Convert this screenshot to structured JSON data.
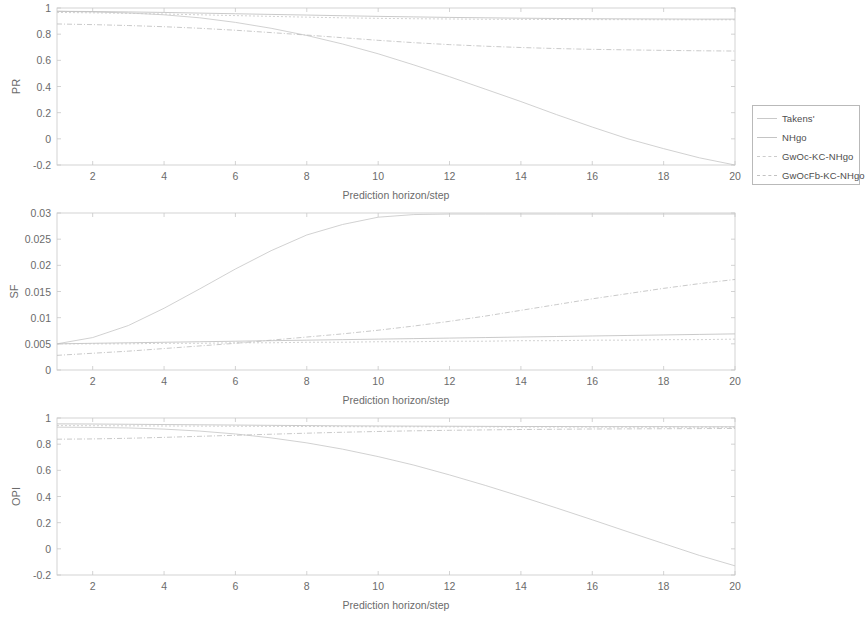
{
  "legend": {
    "items": [
      {
        "label": "Takens'",
        "color": "#c9c9c9",
        "dash": "none"
      },
      {
        "label": "NHgo",
        "color": "#c4c4c4",
        "dash": "none"
      },
      {
        "label": "GwOc-KC-NHgo",
        "color": "#cccccc",
        "dash": "2,2"
      },
      {
        "label": "GwOcFb-KC-NHgo",
        "color": "#c2c2c2",
        "dash": "4,2"
      }
    ]
  },
  "chart_data": [
    {
      "type": "line",
      "title": "",
      "xlabel": "Prediction horizon/step",
      "ylabel": "PR",
      "xlim": [
        1,
        20
      ],
      "ylim": [
        -0.2,
        1
      ],
      "xticks": [
        2,
        4,
        6,
        8,
        10,
        12,
        14,
        16,
        18,
        20
      ],
      "yticks": [
        -0.2,
        0,
        0.2,
        0.4,
        0.6,
        0.8,
        1
      ],
      "grid": false,
      "legend_position": "outside-right",
      "x": [
        1,
        2,
        3,
        4,
        5,
        6,
        7,
        8,
        9,
        10,
        11,
        12,
        13,
        14,
        15,
        16,
        17,
        18,
        19,
        20
      ],
      "series": [
        {
          "name": "Takens'",
          "values": [
            0.975,
            0.97,
            0.962,
            0.948,
            0.925,
            0.89,
            0.845,
            0.79,
            0.725,
            0.65,
            0.565,
            0.475,
            0.38,
            0.285,
            0.185,
            0.09,
            0.0,
            -0.075,
            -0.145,
            -0.2
          ]
        },
        {
          "name": "NHgo",
          "values": [
            0.975,
            0.973,
            0.97,
            0.966,
            0.961,
            0.956,
            0.951,
            0.946,
            0.941,
            0.936,
            0.932,
            0.928,
            0.925,
            0.922,
            0.92,
            0.918,
            0.917,
            0.916,
            0.915,
            0.915
          ]
        },
        {
          "name": "GwOc-KC-NHgo",
          "values": [
            0.966,
            0.963,
            0.959,
            0.954,
            0.948,
            0.942,
            0.936,
            0.93,
            0.925,
            0.921,
            0.918,
            0.916,
            0.914,
            0.913,
            0.912,
            0.911,
            0.911,
            0.91,
            0.91,
            0.91
          ]
        },
        {
          "name": "GwOcFb-KC-NHgo",
          "values": [
            0.878,
            0.873,
            0.866,
            0.857,
            0.845,
            0.83,
            0.812,
            0.793,
            0.773,
            0.753,
            0.735,
            0.72,
            0.708,
            0.698,
            0.69,
            0.684,
            0.68,
            0.676,
            0.673,
            0.671
          ]
        }
      ]
    },
    {
      "type": "line",
      "title": "",
      "xlabel": "Prediction horizon/step",
      "ylabel": "SF",
      "xlim": [
        1,
        20
      ],
      "ylim": [
        0,
        0.03
      ],
      "xticks": [
        2,
        4,
        6,
        8,
        10,
        12,
        14,
        16,
        18,
        20
      ],
      "yticks": [
        0,
        0.005,
        0.01,
        0.015,
        0.02,
        0.025,
        0.03
      ],
      "grid": false,
      "legend_position": "none",
      "x": [
        1,
        2,
        3,
        4,
        5,
        6,
        7,
        8,
        9,
        10,
        11,
        12,
        13,
        14,
        15,
        16,
        17,
        18,
        19,
        20
      ],
      "series": [
        {
          "name": "Takens'",
          "values": [
            0.005,
            0.0062,
            0.0085,
            0.0118,
            0.0155,
            0.0193,
            0.0228,
            0.0258,
            0.0278,
            0.0292,
            0.0297,
            0.0298,
            0.0298,
            0.0298,
            0.0298,
            0.0298,
            0.0298,
            0.0298,
            0.0298,
            0.0298
          ]
        },
        {
          "name": "NHgo",
          "values": [
            0.005,
            0.0051,
            0.0052,
            0.0053,
            0.0054,
            0.0055,
            0.0056,
            0.0057,
            0.0058,
            0.0059,
            0.006,
            0.0061,
            0.0062,
            0.0063,
            0.0064,
            0.0065,
            0.0066,
            0.0067,
            0.0068,
            0.0069
          ]
        },
        {
          "name": "GwOc-KC-NHgo",
          "values": [
            0.005,
            0.005,
            0.005,
            0.0051,
            0.0051,
            0.0052,
            0.0052,
            0.0053,
            0.0053,
            0.0054,
            0.0054,
            0.0055,
            0.0055,
            0.0056,
            0.0056,
            0.0057,
            0.0057,
            0.0058,
            0.0058,
            0.0059
          ]
        },
        {
          "name": "GwOcFb-KC-NHgo",
          "values": [
            0.0028,
            0.0032,
            0.0036,
            0.0041,
            0.0046,
            0.0051,
            0.0057,
            0.0063,
            0.0069,
            0.0076,
            0.0084,
            0.0093,
            0.0103,
            0.0114,
            0.0125,
            0.0136,
            0.0146,
            0.0156,
            0.0165,
            0.0173
          ]
        }
      ]
    },
    {
      "type": "line",
      "title": "",
      "xlabel": "Prediction horizon/step",
      "ylabel": "OPI",
      "xlim": [
        1,
        20
      ],
      "ylim": [
        -0.2,
        1
      ],
      "xticks": [
        2,
        4,
        6,
        8,
        10,
        12,
        14,
        16,
        18,
        20
      ],
      "yticks": [
        -0.2,
        0,
        0.2,
        0.4,
        0.6,
        0.8,
        1
      ],
      "grid": false,
      "legend_position": "none",
      "x": [
        1,
        2,
        3,
        4,
        5,
        6,
        7,
        8,
        9,
        10,
        11,
        12,
        13,
        14,
        15,
        16,
        17,
        18,
        19,
        20
      ],
      "series": [
        {
          "name": "Takens'",
          "values": [
            0.93,
            0.928,
            0.924,
            0.915,
            0.9,
            0.878,
            0.848,
            0.81,
            0.762,
            0.705,
            0.64,
            0.565,
            0.485,
            0.4,
            0.312,
            0.222,
            0.13,
            0.04,
            -0.05,
            -0.13
          ]
        },
        {
          "name": "NHgo",
          "values": [
            0.955,
            0.954,
            0.952,
            0.95,
            0.948,
            0.946,
            0.944,
            0.942,
            0.94,
            0.939,
            0.938,
            0.937,
            0.936,
            0.935,
            0.935,
            0.934,
            0.934,
            0.934,
            0.933,
            0.933
          ]
        },
        {
          "name": "GwOc-KC-NHgo",
          "values": [
            0.942,
            0.941,
            0.94,
            0.939,
            0.938,
            0.937,
            0.936,
            0.935,
            0.934,
            0.933,
            0.933,
            0.932,
            0.932,
            0.931,
            0.931,
            0.931,
            0.93,
            0.93,
            0.93,
            0.93
          ]
        },
        {
          "name": "GwOcFb-KC-NHgo",
          "values": [
            0.838,
            0.84,
            0.845,
            0.852,
            0.86,
            0.868,
            0.876,
            0.884,
            0.891,
            0.897,
            0.902,
            0.906,
            0.909,
            0.912,
            0.914,
            0.916,
            0.917,
            0.918,
            0.919,
            0.92
          ]
        }
      ]
    }
  ]
}
